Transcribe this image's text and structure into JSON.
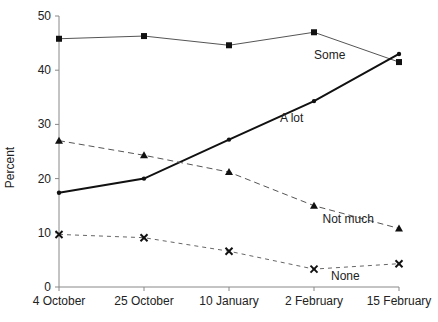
{
  "chart_data": {
    "type": "line",
    "title": "",
    "xlabel": "",
    "ylabel": "Percent",
    "ylim": [
      0,
      50
    ],
    "yticks": [
      0,
      10,
      20,
      30,
      40,
      50
    ],
    "grid": false,
    "legend": "inline labels",
    "categories": [
      "4 October",
      "25 October",
      "10 January",
      "2 February",
      "15 February"
    ],
    "series": [
      {
        "name": "Some",
        "marker": "square",
        "line": "solid-thin",
        "color": "#333333",
        "values": [
          45.8,
          46.3,
          44.6,
          47.0,
          41.5
        ],
        "label_at": [
          3.0,
          42.0
        ]
      },
      {
        "name": "A lot",
        "marker": "diamond",
        "line": "solid-thick",
        "color": "#111111",
        "values": [
          17.4,
          20.0,
          27.2,
          34.3,
          43.0
        ],
        "label_at": [
          2.6,
          30.5
        ]
      },
      {
        "name": "Not much",
        "marker": "triangle",
        "line": "dashed",
        "color": "#333333",
        "values": [
          27.0,
          24.3,
          21.2,
          15.0,
          10.8
        ],
        "label_at": [
          3.1,
          11.8
        ]
      },
      {
        "name": "None",
        "marker": "x",
        "line": "dashed-fine",
        "color": "#333333",
        "values": [
          9.7,
          9.1,
          6.6,
          3.3,
          4.3
        ],
        "label_at": [
          3.2,
          1.3
        ]
      }
    ]
  }
}
